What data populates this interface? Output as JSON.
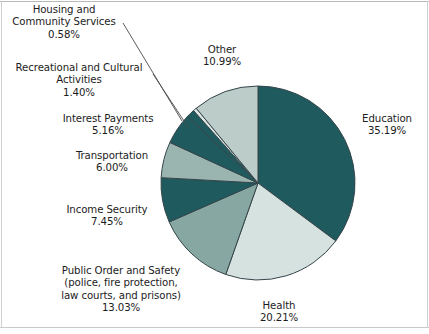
{
  "figure": {
    "kind": "pie-chart",
    "background": "#ffffff",
    "border_color": "#bdbdbd"
  },
  "chart_data": {
    "type": "pie",
    "title": "",
    "subtitle": "",
    "xlabel": "",
    "ylabel": "",
    "grid": false,
    "legend": "none",
    "value_unit": "percent",
    "start_angle_deg": 0,
    "direction": "clockwise",
    "total": 100.01,
    "categories": [
      "Education",
      "Health",
      "Public Order and Safety (police, fire protection, law courts, and prisons)",
      "Income Security",
      "Transportation",
      "Interest Payments",
      "Recreational and Cultural Activities",
      "Housing and Community Services",
      "Other"
    ],
    "values": [
      35.19,
      20.21,
      13.03,
      7.45,
      6.0,
      5.16,
      1.4,
      0.58,
      10.99
    ],
    "colors": [
      "#1e5a5e",
      "#d6e2df",
      "#86a7a2",
      "#1e5a5e",
      "#9ab4b0",
      "#1e5a5e",
      "#1e5a5e",
      "#dfe8e5",
      "#bcccc8"
    ],
    "slice_border_color": "#35454a",
    "slices": [
      {
        "name": "Education",
        "value": 35.19,
        "label": "Education",
        "pct_text": "35.19%",
        "color": "#1e5a5e"
      },
      {
        "name": "Health",
        "value": 20.21,
        "label": "Health",
        "pct_text": "20.21%",
        "color": "#d6e2df"
      },
      {
        "name": "Public Order and Safety",
        "value": 13.03,
        "label": "Public Order and Safety",
        "pct_text": "13.03%",
        "color": "#86a7a2"
      },
      {
        "name": "Income Security",
        "value": 7.45,
        "label": "Income Security",
        "pct_text": "7.45%",
        "color": "#1e5a5e"
      },
      {
        "name": "Transportation",
        "value": 6.0,
        "label": "Transportation",
        "pct_text": "6.00%",
        "color": "#9ab4b0"
      },
      {
        "name": "Interest Payments",
        "value": 5.16,
        "label": "Interest Payments",
        "pct_text": "5.16%",
        "color": "#1e5a5e"
      },
      {
        "name": "Recreational and Cultural Activities",
        "value": 1.4,
        "label": "Recreational and Cultural Activities",
        "pct_text": "1.40%",
        "color": "#1e5a5e"
      },
      {
        "name": "Housing and Community Services",
        "value": 0.58,
        "label": "Housing and Community Services",
        "pct_text": "0.58%",
        "color": "#dfe8e5"
      },
      {
        "name": "Other",
        "value": 10.99,
        "label": "Other",
        "pct_text": "10.99%",
        "color": "#bcccc8"
      }
    ]
  },
  "labels": {
    "housing": {
      "line1": "Housing and",
      "line2": "Community Services",
      "pct": "0.58%"
    },
    "recreational": {
      "line1": "Recreational and Cultural",
      "line2": "Activities",
      "pct": "1.40%"
    },
    "interest": {
      "line1": "Interest Payments",
      "pct": "5.16%"
    },
    "transportation": {
      "line1": "Transportation",
      "pct": "6.00%"
    },
    "income_security": {
      "line1": "Income Security",
      "pct": "7.45%"
    },
    "public_order": {
      "line1": "Public Order and Safety",
      "line2": "(police, fire protection,",
      "line3": "law courts, and prisons)",
      "pct": "13.03%"
    },
    "health": {
      "line1": "Health",
      "pct": "20.21%"
    },
    "education": {
      "line1": "Education",
      "pct": "35.19%"
    },
    "other": {
      "line1": "Other",
      "pct": "10.99%"
    }
  }
}
